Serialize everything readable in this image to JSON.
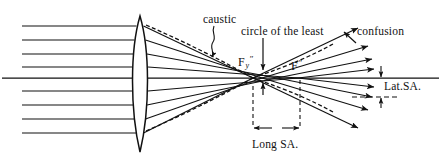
{
  "figure": {
    "type": "optics-ray-diagram",
    "width": 441,
    "height": 162,
    "background_color": "#ffffff",
    "ink_color": "#111111"
  },
  "labels": {
    "caustic": "caustic",
    "circle_of_least": "circle of the least",
    "confusion": "confusion",
    "lateral_sa": "Lat.SA.",
    "longitudinal_sa": "Long SA.",
    "focus_paraxial_base": "F",
    "focus_paraxial_sub": "y",
    "focus_paraxial_prime": "″",
    "focus_marginal_base": "F",
    "focus_marginal_prime": "″"
  },
  "optics": {
    "lens": {
      "kind": "biconvex",
      "center_x": 140,
      "top_y": 16,
      "bottom_y": 152,
      "half_thickness": 9
    },
    "optical_axis_y": 78,
    "incoming_rays_y": [
      26,
      40,
      54,
      67,
      91,
      105,
      119,
      133
    ],
    "incoming_ray_start_x": 22,
    "focus_paraxial_x": 300,
    "focus_marginal_x": 253,
    "lateral_sa_top_y": 78,
    "lateral_sa_bottom_y": 97,
    "long_sa_dim_y": 128,
    "long_sa_left_x": 253,
    "long_sa_right_x": 300
  },
  "annotations": {
    "caustic_leader": "squiggle leader from label down-left to caustic curve",
    "circle_leader": "vertical arrow pointing down to circle of least confusion",
    "confusion_leader": "arrow pointing up-left from label",
    "long_sa_dimension": "horizontal double arrow between marginal and paraxial focus",
    "lat_sa_dimension": "vertical double arrow between axis and dashed ray height"
  }
}
